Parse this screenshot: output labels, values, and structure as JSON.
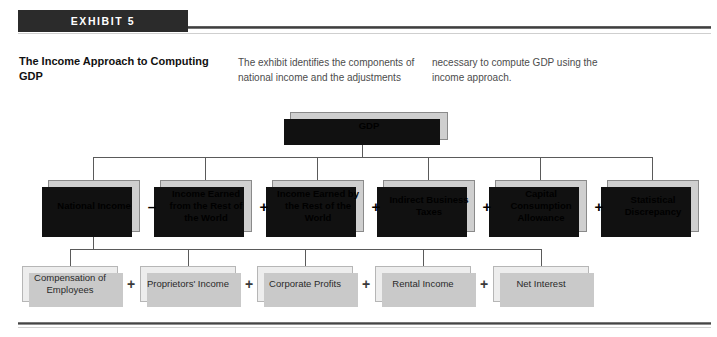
{
  "header": {
    "exhibit_label": "EXHIBIT 5",
    "title": "The Income Approach to Computing GDP",
    "description_col1": "The exhibit identifies the components of national income and the adjustments",
    "description_col2": "necessary to compute GDP using the income approach."
  },
  "diagram": {
    "root": {
      "label": "GDP"
    },
    "row2": [
      {
        "label": "National Income",
        "operator_after": "–"
      },
      {
        "label": "Income Earned from the Rest of the World",
        "operator_after": "+"
      },
      {
        "label": "Income Earned by the Rest of the World",
        "operator_after": "+"
      },
      {
        "label": "Indirect Business Taxes",
        "operator_after": "+"
      },
      {
        "label": "Capital Consumption Allowance",
        "operator_after": "+"
      },
      {
        "label": "Statistical Discrepancy",
        "operator_after": ""
      }
    ],
    "row3": [
      {
        "label": "Compensation of Employees",
        "operator_after": "+"
      },
      {
        "label": "Proprietors' Income",
        "operator_after": "+"
      },
      {
        "label": "Corporate Profits",
        "operator_after": "+"
      },
      {
        "label": "Rental Income",
        "operator_after": "+"
      },
      {
        "label": "Net Interest",
        "operator_after": ""
      }
    ]
  },
  "colors": {
    "header_bar": "#2b2b2b",
    "node_fill_dark": "#cfcfcf",
    "node_fill_light": "#ededed",
    "shadow_dark": "#111111",
    "shadow_light": "#c9c9c9",
    "connector": "#5a5a5a",
    "text_body": "#4c4c4c"
  }
}
